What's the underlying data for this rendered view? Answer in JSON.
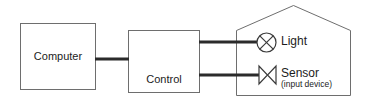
{
  "diagram": {
    "nodes": {
      "computer": {
        "label": "Computer",
        "shape": "rectangle"
      },
      "control_unit": {
        "label_line1": "Control",
        "label_line2": "Unit",
        "shape": "rectangle"
      },
      "light": {
        "label": "Light",
        "symbol": "lamp-circle-cross-icon"
      },
      "sensor": {
        "label": "Sensor",
        "sublabel": "(input device)",
        "symbol": "sensor-bowtie-icon"
      },
      "room": {
        "label": "",
        "shape": "house-outline"
      }
    },
    "connections": [
      {
        "name": "computer-to-control-unit",
        "from": "computer",
        "to": "control_unit"
      },
      {
        "name": "control-unit-to-light",
        "from": "control_unit",
        "to": "light"
      },
      {
        "name": "control-unit-to-sensor",
        "from": "sensor",
        "to": "control_unit"
      }
    ],
    "colors": {
      "background": "#ffffff",
      "box_border": "#6e6e6e",
      "wire": "#2b2b2b",
      "symbol": "#3a3a3a",
      "text": "#1c1c1c"
    }
  }
}
